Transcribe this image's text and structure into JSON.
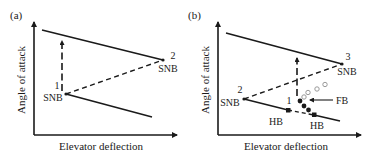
{
  "panels": [
    {
      "id": "a",
      "label": "(a)",
      "xlabel": "Elevator deflection",
      "ylabel": "Angle of attack",
      "points": [
        {
          "num": "1",
          "type": "SNB"
        },
        {
          "num": "2",
          "type": "SNB"
        }
      ]
    },
    {
      "id": "b",
      "label": "(b)",
      "xlabel": "Elevator deflection",
      "ylabel": "Angle of attack",
      "points": [
        {
          "num": "1",
          "type": ""
        },
        {
          "num": "2",
          "type": "SNB"
        },
        {
          "num": "3",
          "type": "SNB"
        }
      ],
      "annotations": {
        "hb_left": "HB",
        "hb_right": "HB",
        "fb": "FB"
      }
    }
  ],
  "colors": {
    "line": "#1a1a1a",
    "open_circle": "#9a9a9a"
  }
}
